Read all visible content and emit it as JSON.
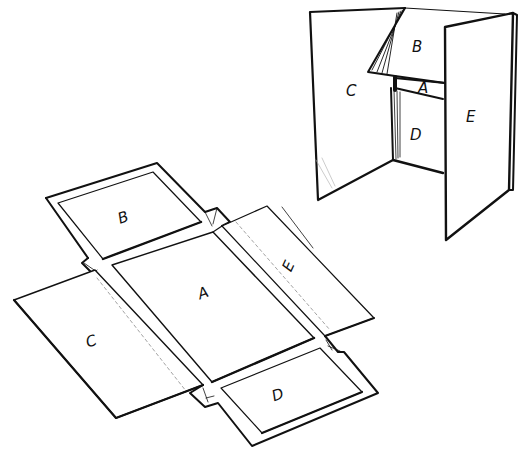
{
  "diagram": {
    "colors": {
      "ink": "#111111",
      "paper": "#ffffff",
      "fold_line": "#999999"
    },
    "assembled_box": {
      "labels": [
        {
          "id": "C",
          "text": "C"
        },
        {
          "id": "B",
          "text": "B"
        },
        {
          "id": "A",
          "text": "A"
        },
        {
          "id": "D",
          "text": "D"
        },
        {
          "id": "E",
          "text": "E"
        }
      ]
    },
    "flat_net": {
      "labels": [
        {
          "id": "B",
          "text": "B"
        },
        {
          "id": "A",
          "text": "A"
        },
        {
          "id": "E",
          "text": "E"
        },
        {
          "id": "C",
          "text": "C"
        },
        {
          "id": "D",
          "text": "D"
        }
      ]
    }
  }
}
